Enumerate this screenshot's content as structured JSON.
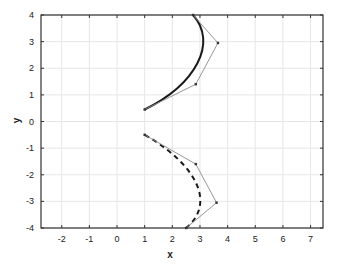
{
  "chart_data": {
    "type": "line",
    "title": "",
    "xlabel": "x",
    "ylabel": "y",
    "xlim": [
      -2.75,
      7.45
    ],
    "ylim": [
      -4,
      4
    ],
    "grid": true,
    "legend": null,
    "x_ticks": [
      -2,
      -1,
      0,
      1,
      2,
      3,
      4,
      5,
      6,
      7
    ],
    "y_ticks": [
      -4,
      -3,
      -2,
      -1,
      0,
      1,
      2,
      3,
      4
    ],
    "series": [
      {
        "name": "upper-bezier-curve",
        "kind": "cubic-bezier",
        "style": "solid-thick",
        "color": "#1a1a1a",
        "control_points": [
          [
            1.0,
            0.45
          ],
          [
            2.85,
            1.4
          ],
          [
            3.65,
            2.95
          ],
          [
            2.75,
            4.0
          ]
        ]
      },
      {
        "name": "upper-control-polygon",
        "kind": "polyline",
        "style": "thin-markers",
        "color": "#8a8a8a",
        "points": [
          [
            1.0,
            0.45
          ],
          [
            2.85,
            1.4
          ],
          [
            3.65,
            2.95
          ],
          [
            2.75,
            4.0
          ]
        ]
      },
      {
        "name": "lower-bezier-curve",
        "kind": "cubic-bezier",
        "style": "dashed-thick",
        "color": "#1a1a1a",
        "control_points": [
          [
            1.0,
            -0.5
          ],
          [
            2.85,
            -1.6
          ],
          [
            3.6,
            -3.05
          ],
          [
            2.5,
            -4.0
          ]
        ]
      },
      {
        "name": "lower-control-polygon",
        "kind": "polyline",
        "style": "thin-markers",
        "color": "#8a8a8a",
        "points": [
          [
            1.0,
            -0.5
          ],
          [
            2.85,
            -1.6
          ],
          [
            3.6,
            -3.05
          ],
          [
            2.5,
            -4.0
          ]
        ]
      }
    ]
  },
  "layout": {
    "plot_left": 41,
    "plot_right": 323,
    "plot_top": 15,
    "plot_bottom": 228,
    "colors": {
      "axis": "#333333",
      "grid": "#e6e6e6"
    }
  }
}
